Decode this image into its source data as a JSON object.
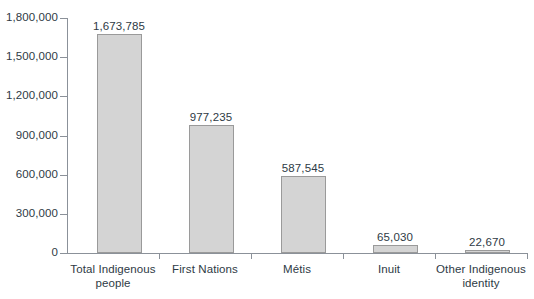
{
  "chart_data": {
    "type": "bar",
    "title": "",
    "subtitle": "",
    "xlabel": "",
    "ylabel": "",
    "categories": [
      "Total Indigenous people",
      "First Nations",
      "Métis",
      "Inuit",
      "Other Indigenous identity"
    ],
    "values": [
      1673785,
      977235,
      587545,
      65030,
      22670
    ],
    "value_labels": [
      "1,673,785",
      "977,235",
      "587,545",
      "65,030",
      "22,670"
    ],
    "category_lines": [
      [
        "Total Indigenous",
        "people"
      ],
      [
        "First Nations"
      ],
      [
        "Métis"
      ],
      [
        "Inuit"
      ],
      [
        "Other Indigenous",
        "identity"
      ]
    ],
    "ylim": [
      0,
      1800000
    ],
    "ytick_values": [
      0,
      300000,
      600000,
      900000,
      1200000,
      1500000,
      1800000
    ],
    "ytick_labels": [
      "0",
      "300,000",
      "600,000",
      "900,000",
      "1,200,000",
      "1,500,000",
      "1,800,000"
    ],
    "grid": false,
    "legend": false,
    "legend_position": "none",
    "colors": {
      "bar_fill": "#d4d4d4",
      "bar_border": "#9a9a9a",
      "axis": "#8b9199",
      "text": "#2e3a45",
      "background": "#ffffff"
    }
  }
}
